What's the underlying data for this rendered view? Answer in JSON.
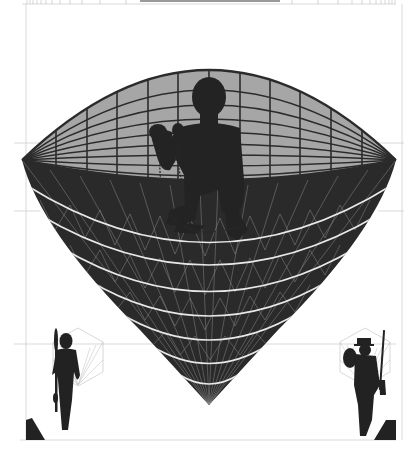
{
  "artwork": {
    "title": "",
    "description": "Graphic illustration: lens/bowl shaped globe with grid, crouched chained figure silhouette in center, two small standing figures in lower corners",
    "colors": {
      "background": "#ffffff",
      "guide_lines": "#c8c8c8",
      "lens_fill": "#a6a6a6",
      "grid_stroke": "#2b2b2b",
      "bowl_fill": "#2a2a2a",
      "bowl_lines": "#e6e6e6",
      "silhouette": "#232323",
      "hexagon_rays": "#b5b5b5"
    },
    "figures": [
      {
        "name": "central-chained-figure",
        "position": "center"
      },
      {
        "name": "left-spear-figure",
        "position": "bottom-left"
      },
      {
        "name": "right-rifle-figure",
        "position": "bottom-right"
      }
    ]
  }
}
